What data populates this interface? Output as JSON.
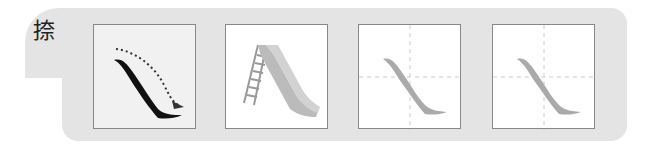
{
  "character": "捺",
  "stroke_name": "na (right-falling stroke)",
  "boxes": [
    {
      "id": "stroke-direction",
      "description": "black na stroke with dotted arrow showing direction"
    },
    {
      "id": "slide-illustration",
      "description": "playground slide with ladder"
    },
    {
      "id": "trace-grid-1",
      "description": "gray tracing stroke in dashed cross grid"
    },
    {
      "id": "trace-grid-2",
      "description": "gray tracing stroke in dashed cross grid"
    }
  ],
  "colors": {
    "panel": "#e4e4e4",
    "stroke": "#111111",
    "trace": "#aaaaaa",
    "grid": "#cccccc"
  }
}
